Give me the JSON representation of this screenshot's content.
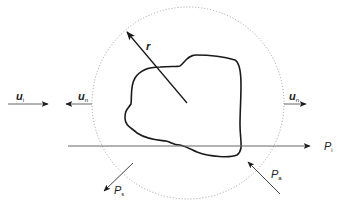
{
  "diagram": {
    "colors": {
      "line": "#222222",
      "body": "#1a1a1a",
      "control_surface": "#9a9a9a",
      "incident_line": "#666666"
    },
    "control_surface": {
      "shape": "circle",
      "style": "dotted",
      "cx": 188,
      "cy": 103,
      "r": 96
    },
    "labels": {
      "u_i": {
        "main": "u",
        "sub": "i"
      },
      "u_n_left": {
        "main": "u",
        "sub": "n"
      },
      "u_n_right": {
        "main": "u",
        "sub": "n"
      },
      "r": {
        "main": "r"
      },
      "P_i": {
        "main": "P",
        "sub": "i"
      },
      "P_s": {
        "main": "P",
        "sub": "s"
      },
      "P_a": {
        "main": "P",
        "sub": "a"
      }
    },
    "arrows": [
      {
        "name": "incident-direction",
        "label": "u_i",
        "from": [
          8,
          104
        ],
        "to": [
          48,
          104
        ]
      },
      {
        "name": "outward-normal-left",
        "label": "u_n",
        "from": [
          92,
          104
        ],
        "to": [
          68,
          104
        ]
      },
      {
        "name": "outward-normal-right",
        "label": "u_n",
        "from": [
          284,
          104
        ],
        "to": [
          304,
          104
        ]
      },
      {
        "name": "radius-vector",
        "label": "r",
        "from": [
          187,
          103
        ],
        "to": [
          127,
          32
        ]
      },
      {
        "name": "incident-power",
        "label": "P_i",
        "from": [
          68,
          146
        ],
        "to": [
          310,
          146
        ]
      },
      {
        "name": "scattered-power",
        "label": "P_s",
        "from": [
          133,
          163
        ],
        "to": [
          104,
          191
        ]
      },
      {
        "name": "absorbed-power",
        "label": "P_a",
        "from": [
          280,
          194
        ],
        "to": [
          248,
          162
        ]
      }
    ]
  }
}
